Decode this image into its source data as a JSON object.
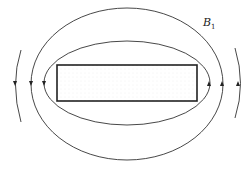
{
  "diagram": {
    "title": "",
    "type": "magnetic field lines around rectangular bar",
    "labels": [
      {
        "text": "B",
        "subscript": "1",
        "x": 203,
        "y": 18
      }
    ],
    "object": {
      "shape": "rectangle",
      "fill": "stippled",
      "x": 57,
      "y": 65,
      "width": 140,
      "height": 36
    },
    "field_lines": [
      {
        "name": "inner-loop",
        "cx": 127,
        "cy": 83,
        "rx": 83,
        "ry": 42,
        "arrow_left": "down",
        "arrow_right": "up"
      },
      {
        "name": "middle-loop",
        "cx": 127,
        "cy": 84,
        "rx": 96,
        "ry": 76,
        "arrow_left": "down",
        "arrow_right": "up"
      },
      {
        "name": "outer-arc-left",
        "x": 16,
        "arrow": "down"
      },
      {
        "name": "outer-arc-right",
        "x": 238,
        "arrow": "up"
      }
    ],
    "colors": {
      "line": "#333333",
      "stipple": "#9a9a9a"
    }
  }
}
